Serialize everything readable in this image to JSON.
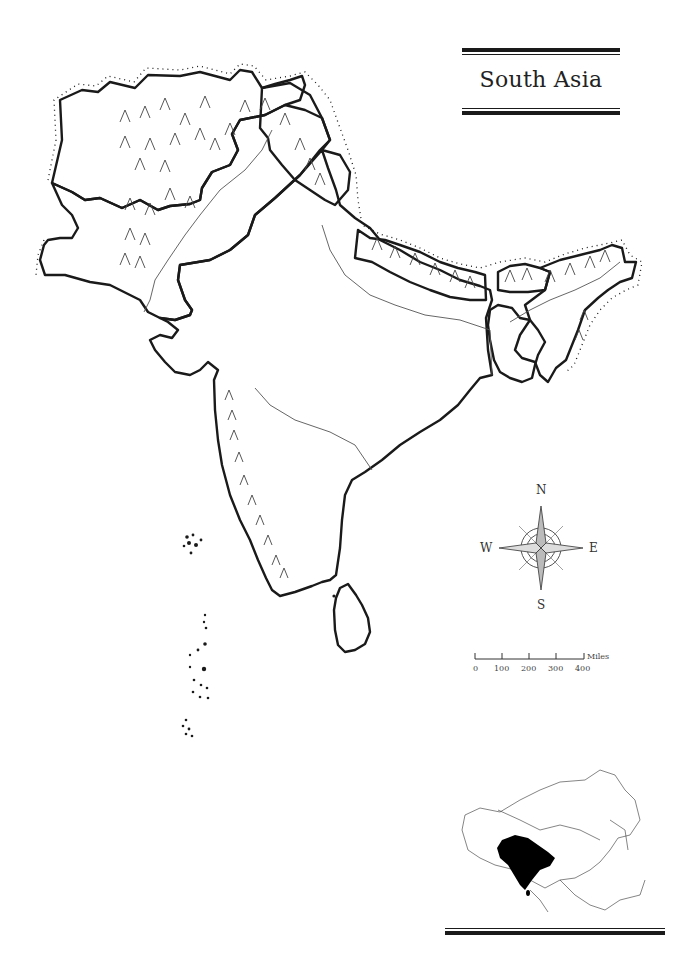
{
  "title": "South Asia",
  "compass": {
    "north": "N",
    "south": "S",
    "east": "E",
    "west": "W"
  },
  "scale_bar": {
    "unit": "Miles",
    "ticks": [
      "0",
      "100",
      "200",
      "300",
      "400"
    ]
  },
  "locator_map": {
    "region": "Asia",
    "highlighted": "South Asia",
    "highlight_color": "#000000"
  },
  "colors": {
    "ink": "#1a1a1a",
    "river": "#555555",
    "background": "#ffffff"
  }
}
